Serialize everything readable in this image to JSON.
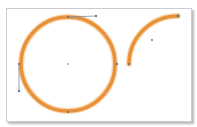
{
  "colors": {
    "stroke": "#E8913A",
    "stroke_glow": "#F6C27E",
    "handle": "#7d8aa3",
    "anchor": "#6f7a90",
    "canvas_border": "#c9ccd2"
  },
  "shapes": {
    "circle": {
      "cx": 68,
      "cy": 64,
      "r": 47,
      "stroke_width": 4
    },
    "arc": {
      "start": [
        129,
        64
      ],
      "end": [
        178,
        16
      ],
      "center": [
        152,
        40
      ]
    },
    "handles": [
      {
        "name": "top-handle",
        "from": [
          68,
          17
        ],
        "to": [
          96,
          16
        ]
      },
      {
        "name": "left-handle",
        "from": [
          19,
          64
        ],
        "to": [
          19,
          91
        ]
      }
    ],
    "anchors": [
      {
        "name": "left-anchor",
        "x": 19,
        "y": 64
      },
      {
        "name": "right-anchor",
        "x": 117,
        "y": 64
      },
      {
        "name": "bottom-anchor",
        "x": 68,
        "y": 112
      },
      {
        "name": "circle-center",
        "x": 68,
        "y": 64
      },
      {
        "name": "arc-start-anchor",
        "x": 129,
        "y": 64
      },
      {
        "name": "arc-end-anchor",
        "x": 178,
        "y": 16
      },
      {
        "name": "arc-center",
        "x": 152,
        "y": 40
      }
    ]
  }
}
